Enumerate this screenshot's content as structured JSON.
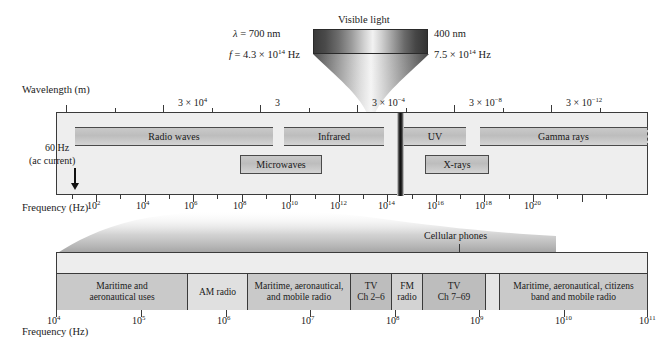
{
  "figure": {
    "caption": ""
  },
  "visible_light": {
    "title": "Visible light",
    "left_wavelength": "λ = 700 nm",
    "left_frequency_prefix": "f = 4.3 × 10",
    "left_frequency_exp": "14",
    "left_frequency_suffix": " Hz",
    "right_wavelength": "400 nm",
    "right_frequency_prefix": "7.5 × 10",
    "right_frequency_exp": "14",
    "right_frequency_suffix": " Hz"
  },
  "upper": {
    "wavelength_axis_title": "Wavelength (m)",
    "frequency_axis_title": "Frequency (Hz)",
    "ac_note_line1": "60 Hz",
    "ac_note_line2": "(ac current)",
    "wavelength_ticks": [
      {
        "label_pre": "3 × 10",
        "label_exp": "4",
        "x": 144
      },
      {
        "label_pre": "3",
        "label_exp": "",
        "x": 241
      },
      {
        "label_pre": "3 × 10",
        "label_exp": "−4",
        "x": 338
      },
      {
        "label_pre": "3 × 10",
        "label_exp": "−8",
        "x": 435
      },
      {
        "label_pre": "3 × 10",
        "label_exp": "−12",
        "x": 532
      }
    ],
    "frequency_ticks": [
      {
        "label_pre": "10",
        "label_exp": "2",
        "x": 96
      },
      {
        "label_pre": "10",
        "label_exp": "4",
        "x": 145
      },
      {
        "label_pre": "10",
        "label_exp": "6",
        "x": 193
      },
      {
        "label_pre": "10",
        "label_exp": "8",
        "x": 242
      },
      {
        "label_pre": "10",
        "label_exp": "10",
        "x": 290
      },
      {
        "label_pre": "10",
        "label_exp": "12",
        "x": 339
      },
      {
        "label_pre": "10",
        "label_exp": "14",
        "x": 387
      },
      {
        "label_pre": "10",
        "label_exp": "16",
        "x": 436
      },
      {
        "label_pre": "10",
        "label_exp": "18",
        "x": 484
      },
      {
        "label_pre": "10",
        "label_exp": "20",
        "x": 533
      }
    ],
    "bands_row1": [
      {
        "name": "Radio waves",
        "left": 18,
        "width": 198
      },
      {
        "name": "Infrared",
        "left": 227,
        "width": 100
      },
      {
        "name": "UV",
        "left": 347,
        "width": 62
      },
      {
        "name": "Gamma rays",
        "left": 423,
        "width": 168,
        "dashed_right": true
      }
    ],
    "bands_row2": [
      {
        "name": "Microwaves",
        "left": 183,
        "width": 82
      },
      {
        "name": "X-rays",
        "left": 368,
        "width": 64
      }
    ]
  },
  "lower": {
    "frequency_axis_title": "Frequency (Hz)",
    "cellular_label": "Cellular phones",
    "ticks": [
      {
        "label_pre": "10",
        "label_exp": "4",
        "x": 0
      },
      {
        "label_pre": "10",
        "label_exp": "5",
        "x": 85
      },
      {
        "label_pre": "10",
        "label_exp": "6",
        "x": 170
      },
      {
        "label_pre": "10",
        "label_exp": "7",
        "x": 254
      },
      {
        "label_pre": "10",
        "label_exp": "8",
        "x": 339
      },
      {
        "label_pre": "10",
        "label_exp": "9",
        "x": 423
      },
      {
        "label_pre": "10",
        "label_exp": "10",
        "x": 508
      },
      {
        "label_pre": "10",
        "label_exp": "11",
        "x": 592
      }
    ],
    "segments": [
      {
        "line1": "Maritime and",
        "line2": "aeronautical uses",
        "width": 131,
        "shade": "#c9c9c9"
      },
      {
        "line1": "AM radio",
        "line2": "",
        "width": 60,
        "shade": "#e0e0e0"
      },
      {
        "line1": "Maritime, aeronautical,",
        "line2": "and mobile radio",
        "width": 103,
        "shade": "#c9c9c9"
      },
      {
        "line1": "TV",
        "line2": "Ch 2–6",
        "width": 41,
        "shade": "#bdbdbd"
      },
      {
        "line1": "FM",
        "line2": "radio",
        "width": 31,
        "shade": "#d3d3d3"
      },
      {
        "line1": "TV",
        "line2": "Ch 7–69",
        "width": 63,
        "shade": "#bdbdbd"
      },
      {
        "line1": "",
        "line2": "",
        "width": 14,
        "shade": "#e5e5e5"
      },
      {
        "line1": "Maritime, aeronautical, citizens",
        "line2": "band and mobile radio",
        "width": 147,
        "shade": "#c9c9c9"
      }
    ]
  }
}
